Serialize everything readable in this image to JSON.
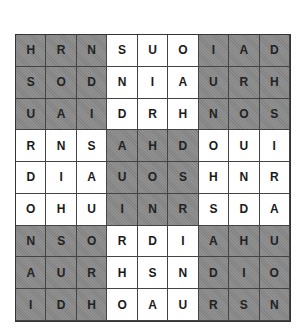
{
  "puzzle": {
    "size": 9,
    "shaded_color": "#8a8a8a",
    "light_color": "#ffffff",
    "rows": [
      [
        "H",
        "R",
        "N",
        "S",
        "U",
        "O",
        "I",
        "A",
        "D"
      ],
      [
        "S",
        "O",
        "D",
        "N",
        "I",
        "A",
        "U",
        "R",
        "H"
      ],
      [
        "U",
        "A",
        "I",
        "D",
        "R",
        "H",
        "N",
        "O",
        "S"
      ],
      [
        "R",
        "N",
        "S",
        "A",
        "H",
        "D",
        "O",
        "U",
        "I"
      ],
      [
        "D",
        "I",
        "A",
        "U",
        "O",
        "S",
        "H",
        "N",
        "R"
      ],
      [
        "O",
        "H",
        "U",
        "I",
        "N",
        "R",
        "S",
        "D",
        "A"
      ],
      [
        "N",
        "S",
        "O",
        "R",
        "D",
        "I",
        "A",
        "H",
        "U"
      ],
      [
        "A",
        "U",
        "R",
        "H",
        "S",
        "N",
        "D",
        "I",
        "O"
      ],
      [
        "I",
        "D",
        "H",
        "O",
        "A",
        "U",
        "R",
        "S",
        "N"
      ]
    ]
  }
}
